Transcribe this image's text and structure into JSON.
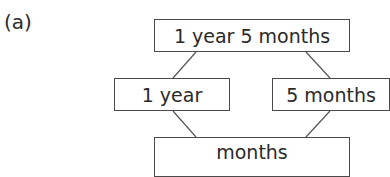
{
  "part_label": "(a)",
  "number_bond": {
    "whole": "1 year 5 months",
    "part_left": "1 year",
    "part_right": "5 months",
    "result": "months"
  }
}
